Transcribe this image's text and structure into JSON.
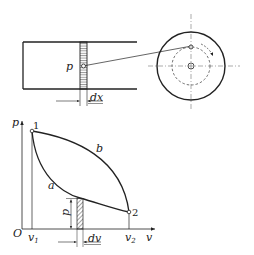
{
  "figure": {
    "top_diagram": {
      "description": "Piston in cylinder connected by rod to rotating crank wheel",
      "labels": {
        "pressure": "p",
        "displacement": "dx"
      }
    },
    "pv_diagram": {
      "axis": {
        "y_label": "p",
        "x_label": "v",
        "origin": "O"
      },
      "points": {
        "start": "1",
        "end": "2"
      },
      "curves": {
        "upper": "b",
        "lower": "a"
      },
      "ticks": {
        "v1_main": "v",
        "v1_sub": "1",
        "v2_main": "v",
        "v2_sub": "2"
      },
      "strip": {
        "height_label": "p",
        "width_label": "dv"
      }
    }
  },
  "colors": {
    "line": "#222222",
    "background": "#ffffff"
  }
}
